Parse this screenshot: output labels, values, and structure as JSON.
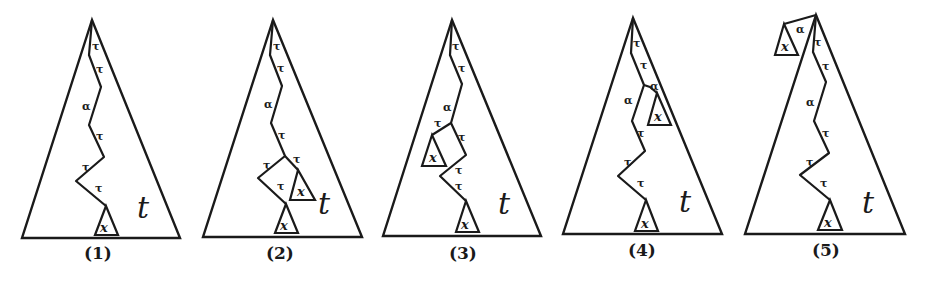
{
  "figure": {
    "panels": [
      {
        "caption": "(1)",
        "tree_label": "t",
        "subtree_labels": [
          "x"
        ],
        "path_labels": [
          "τ",
          "τ",
          "α",
          "τ",
          "τ",
          "τ"
        ]
      },
      {
        "caption": "(2)",
        "tree_label": "t",
        "subtree_labels": [
          "x",
          "x"
        ],
        "path_labels": [
          "τ",
          "τ",
          "α",
          "τ",
          "τ",
          "τ",
          "τ"
        ]
      },
      {
        "caption": "(3)",
        "tree_label": "t",
        "subtree_labels": [
          "x",
          "x"
        ],
        "path_labels": [
          "τ",
          "τ",
          "α",
          "τ",
          "τ",
          "τ",
          "τ"
        ]
      },
      {
        "caption": "(4)",
        "tree_label": "t",
        "subtree_labels": [
          "x",
          "x"
        ],
        "path_labels": [
          "τ",
          "τ",
          "α",
          "α",
          "τ",
          "τ",
          "τ"
        ]
      },
      {
        "caption": "(5)",
        "tree_label": "t",
        "subtree_labels": [
          "x",
          "x"
        ],
        "path_labels": [
          "α",
          "τ",
          "τ",
          "α",
          "τ",
          "τ",
          "τ"
        ]
      }
    ]
  }
}
